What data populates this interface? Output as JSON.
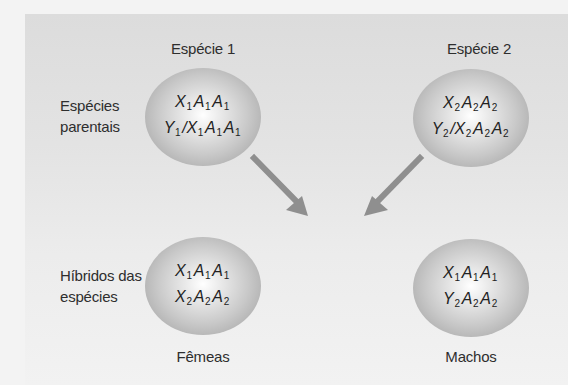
{
  "diagram": {
    "column_headers": {
      "species1": "Espécie 1",
      "species2": "Espécie 2"
    },
    "row_labels": {
      "parental": [
        "Espécies",
        "parentais"
      ],
      "hybrids": [
        "Híbridos das",
        "espécies"
      ]
    },
    "cells": {
      "species1_parental": {
        "line1": [
          {
            "s": "X",
            "n": "1"
          },
          {
            "s": "A",
            "n": "1"
          },
          {
            "s": "A",
            "n": "1"
          }
        ],
        "line2": [
          {
            "s": "Y",
            "n": "1"
          },
          {
            "s": "/X",
            "n": "1"
          },
          {
            "s": "A",
            "n": "1"
          },
          {
            "s": "A",
            "n": "1"
          }
        ],
        "text": "X1 A1 A1 / Y1/X1 A1 A1"
      },
      "species2_parental": {
        "line1": [
          {
            "s": "X",
            "n": "2"
          },
          {
            "s": "A",
            "n": "2"
          },
          {
            "s": "A",
            "n": "2"
          }
        ],
        "line2": [
          {
            "s": "Y",
            "n": "2"
          },
          {
            "s": "/X",
            "n": "2"
          },
          {
            "s": "A",
            "n": "2"
          },
          {
            "s": "A",
            "n": "2"
          }
        ],
        "text": "X2 A2 A2 / Y2/X2 A2 A2"
      },
      "hybrid_females": {
        "line1": [
          {
            "s": "X",
            "n": "1"
          },
          {
            "s": "A",
            "n": "1"
          },
          {
            "s": "A",
            "n": "1"
          }
        ],
        "line2": [
          {
            "s": "X",
            "n": "2"
          },
          {
            "s": "A",
            "n": "2"
          },
          {
            "s": "A",
            "n": "2"
          }
        ],
        "text": "X1 A1 A1 / X2 A2 A2"
      },
      "hybrid_males": {
        "line1": [
          {
            "s": "X",
            "n": "1"
          },
          {
            "s": "A",
            "n": "1"
          },
          {
            "s": "A",
            "n": "1"
          }
        ],
        "line2": [
          {
            "s": "Y",
            "n": "2"
          },
          {
            "s": "A",
            "n": "2"
          },
          {
            "s": "A",
            "n": "2"
          }
        ],
        "text": "X1 A1 A1 / Y2 A2 A2"
      }
    },
    "bottom_labels": {
      "females": "Fêmeas",
      "males": "Machos"
    },
    "arrows": [
      {
        "from": "species1_parental",
        "to": "hybrids",
        "direction": "down-right"
      },
      {
        "from": "species2_parental",
        "to": "hybrids",
        "direction": "down-left"
      }
    ],
    "colors": {
      "panel_top": "#dcdcdc",
      "panel_bottom": "#f2f2f2",
      "page_bg": "#f3f3f3",
      "arrow": "#8f8f8f",
      "cell_edge": "#9d9d9d",
      "text": "#2e2e2e"
    }
  }
}
